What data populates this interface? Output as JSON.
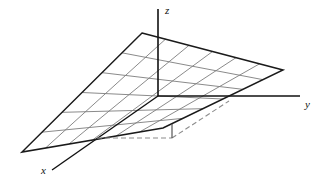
{
  "figure": {
    "background_color": "#ffffff",
    "axis_color": "#111111",
    "edge_color": "#1a1a1a",
    "grid_color": "#7d7d7d",
    "dashed_color": "#8c8c8c",
    "axes": [
      {
        "name": "x",
        "label": "x",
        "label_x": 41,
        "label_y": 174,
        "x1": 158,
        "y1": 96,
        "x2": 52,
        "y2": 170
      },
      {
        "name": "y",
        "label": "y",
        "label_x": 305,
        "label_y": 108,
        "x1": 158,
        "y1": 96,
        "x2": 300,
        "y2": 96
      },
      {
        "name": "z",
        "label": "z",
        "label_x": 165,
        "label_y": 14,
        "x1": 158,
        "y1": 96,
        "x2": 158,
        "y2": 9
      }
    ],
    "plane": {
      "name": "slanted-plane",
      "corners": [
        {
          "label": "top-left",
          "x": 142,
          "y": 33
        },
        {
          "label": "right",
          "x": 283,
          "y": 70
        },
        {
          "label": "bottom-right",
          "x": 163,
          "y": 128
        },
        {
          "label": "left",
          "x": 22,
          "y": 152
        }
      ],
      "grid_divisions_u": 6,
      "grid_divisions_v": 6
    },
    "construction": {
      "name": "height-construction",
      "base_point": {
        "x": 97,
        "y": 138
      },
      "foot_point": {
        "x": 172,
        "y": 138
      },
      "top_point": {
        "x": 172,
        "y": 124
      },
      "plane_point": {
        "x": 229,
        "y": 101
      },
      "horizontal_dashed": {
        "x1": 97,
        "y1": 138,
        "x2": 172,
        "y2": 138
      },
      "vertical_solid": {
        "x1": 172,
        "y1": 138,
        "x2": 172,
        "y2": 124
      },
      "diagonal_dashed": {
        "x1": 172,
        "y1": 138,
        "x2": 229,
        "y2": 101
      }
    }
  }
}
